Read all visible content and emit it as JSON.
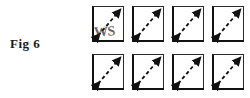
{
  "figure": {
    "caption": "Fig 6",
    "background_color": "#ffffff",
    "ink_color": "#111111"
  },
  "watermark": {
    "text": "WS",
    "on_cell": "row-0-col-0"
  },
  "grid": {
    "rows": 2,
    "columns": 4,
    "cell_shape": "square",
    "cell_contents": "dashed double-headed diagonal arrow",
    "arrow": {
      "direction": "bottom-left to top-right",
      "style": "dashed",
      "heads": "both-ends",
      "color": "#1a1a1a"
    },
    "cells": [
      [
        {
          "id": "cell-r0c0",
          "label": ""
        },
        {
          "id": "cell-r0c1",
          "label": ""
        },
        {
          "id": "cell-r0c2",
          "label": ""
        },
        {
          "id": "cell-r0c3",
          "label": ""
        }
      ],
      [
        {
          "id": "cell-r1c0",
          "label": ""
        },
        {
          "id": "cell-r1c1",
          "label": ""
        },
        {
          "id": "cell-r1c2",
          "label": ""
        },
        {
          "id": "cell-r1c3",
          "label": ""
        }
      ]
    ]
  }
}
